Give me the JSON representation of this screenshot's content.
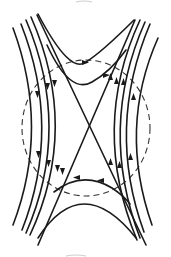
{
  "diagram": {
    "title": "",
    "colors": {
      "line": "#1a1a1a",
      "boundary": "#333333",
      "background": "#ffffff"
    },
    "elements": {
      "boundary_circle": {
        "center": [
          85,
          128
        ],
        "rx": 64,
        "ry": 68,
        "style": "dashed"
      },
      "x_point": {
        "position": [
          87,
          123
        ]
      },
      "separatrices": 2,
      "left_lines": {
        "count": 4,
        "arrow_direction": "down"
      },
      "right_lines": {
        "count": 4,
        "arrow_direction": "up"
      },
      "top_lines": {
        "count": 2,
        "arrow_direction": "right"
      },
      "bottom_lines": {
        "count": 2,
        "arrow_direction": "left"
      }
    },
    "labels": []
  }
}
